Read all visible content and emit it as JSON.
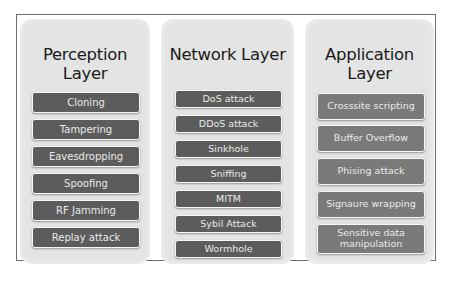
{
  "diagram": {
    "layers": [
      {
        "title": "Perception Layer",
        "items": [
          "Cloning",
          "Tampering",
          "Eavesdropping",
          "Spoofing",
          "RF Jamming",
          "Replay attack"
        ]
      },
      {
        "title": "Network Layer",
        "items": [
          "DoS attack",
          "DDoS attack",
          "Sinkhole",
          "Sniffing",
          "MITM",
          "Sybil Attack",
          "Wormhole"
        ]
      },
      {
        "title": "Application Layer",
        "items": [
          "Crosssite scripting",
          "Buffer Overflow",
          "Phising attack",
          "Signaure wrapping",
          "Sensitive data manipulation"
        ]
      }
    ],
    "colors": {
      "panel_bg": "#e4e4e4",
      "item_bg_dark": "#5c5c5c",
      "item_bg_light": "#7a7a7a",
      "item_text": "#eaeaea",
      "frame_border": "#6e6e6e"
    }
  }
}
